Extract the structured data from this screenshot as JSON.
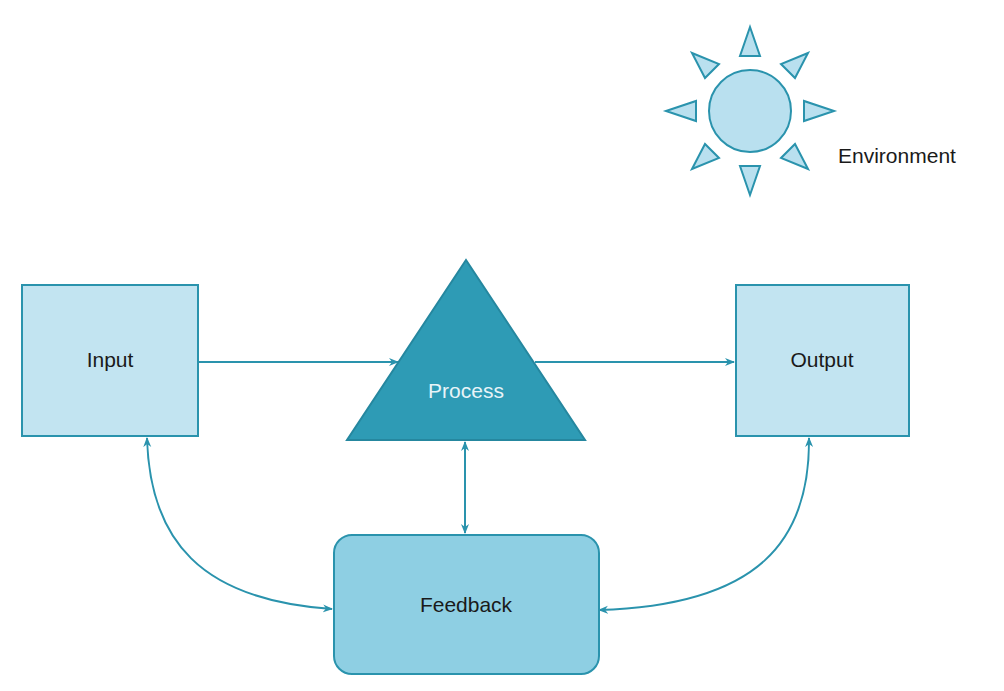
{
  "diagram": {
    "type": "system-model",
    "nodes": {
      "input": {
        "label": "Input",
        "shape": "rectangle"
      },
      "process": {
        "label": "Process",
        "shape": "triangle"
      },
      "output": {
        "label": "Output",
        "shape": "rectangle"
      },
      "feedback": {
        "label": "Feedback",
        "shape": "rounded-rectangle"
      },
      "environment": {
        "label": "Environment",
        "icon": "sun-icon"
      }
    },
    "edges": [
      {
        "from": "Input",
        "to": "Process",
        "direction": "one-way"
      },
      {
        "from": "Process",
        "to": "Output",
        "direction": "one-way"
      },
      {
        "from": "Process",
        "to": "Feedback",
        "direction": "two-way"
      },
      {
        "from": "Input",
        "to": "Feedback",
        "direction": "two-way"
      },
      {
        "from": "Output",
        "to": "Feedback",
        "direction": "two-way"
      }
    ],
    "colors": {
      "light_fill": "#b9e0ef",
      "mid_fill": "#8ecfe3",
      "dark_fill": "#2e9bb5",
      "stroke": "#2a93ad",
      "text": "#1a1a1a",
      "process_text": "#e8f4f8"
    }
  }
}
